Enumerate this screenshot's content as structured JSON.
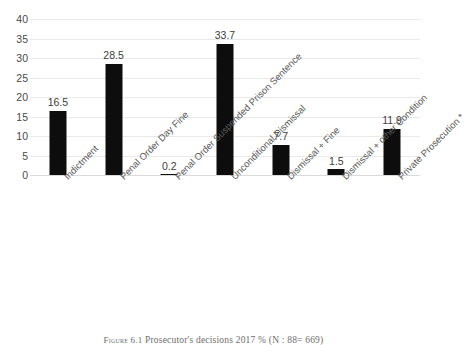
{
  "chart_data": {
    "type": "bar",
    "title": "",
    "xlabel": "",
    "ylabel": "",
    "ylim": [
      0,
      40
    ],
    "ytick_step": 5,
    "yticks": [
      "40",
      "35",
      "30",
      "25",
      "20",
      "15",
      "10",
      "5",
      "0"
    ],
    "grid": true,
    "legend": "none",
    "bar_color": "#0d0d0d",
    "categories": [
      "Indictment",
      "Penal Order Day Fine",
      "Penal Order Suspended Prison Sentence",
      "Unconditional Dismissal",
      "Dismissal + Fine",
      "Dismissal + other Condition",
      "Private Prosecution *"
    ],
    "values": [
      16.5,
      28.5,
      0.2,
      33.7,
      7.7,
      1.5,
      11.9
    ],
    "value_labels": [
      "16.5",
      "28.5",
      "0.2",
      "33.7",
      "7.7",
      "1.5",
      "11.9"
    ]
  },
  "caption": {
    "prefix": "Figure 6.1",
    "text": "Prosecutor's decisions 2017 % (N : 88= 669)"
  }
}
